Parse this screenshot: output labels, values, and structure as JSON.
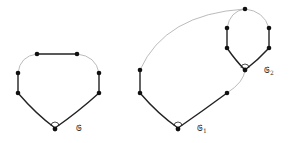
{
  "diagram": {
    "type": "graph-cycles",
    "colors": {
      "thick_edge": "#222222",
      "thin_edge": "#aaaaaa",
      "node": "#111111",
      "background": "#ffffff"
    },
    "graphs": [
      {
        "id": "G",
        "label": "𝔊",
        "subscript": "",
        "label_pos": [
          76,
          131
        ],
        "nodes": [
          [
            37,
            54
          ],
          [
            77,
            54
          ],
          [
            18,
            73
          ],
          [
            18,
            93
          ],
          [
            99,
            73
          ],
          [
            99,
            93
          ],
          [
            55,
            128
          ]
        ],
        "root": [
          55,
          128
        ]
      },
      {
        "id": "G1",
        "label": "𝔊",
        "subscript": "1",
        "label_pos": [
          197,
          131
        ],
        "nodes": [
          [
            140,
            70
          ],
          [
            140,
            93
          ],
          [
            178,
            128
          ],
          [
            227,
            93
          ],
          [
            245,
            70
          ]
        ],
        "root": [
          178,
          128
        ]
      },
      {
        "id": "G2",
        "label": "𝔊",
        "subscript": "2",
        "label_pos": [
          264,
          73
        ],
        "nodes": [
          [
            245,
            9
          ],
          [
            227,
            28
          ],
          [
            227,
            48
          ],
          [
            269,
            28
          ],
          [
            269,
            48
          ],
          [
            245,
            70
          ]
        ],
        "root": [
          245,
          70
        ]
      }
    ]
  }
}
